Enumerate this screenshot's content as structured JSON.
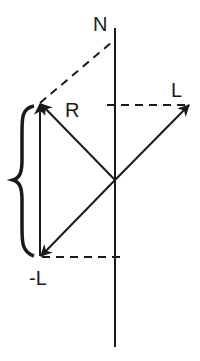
{
  "diagram": {
    "type": "vector-diagram",
    "labels": {
      "axis": "N",
      "vector_r": "R",
      "vector_l": "L",
      "vector_neg_l": "-L"
    },
    "colors": {
      "stroke": "#1a1a1a",
      "background": "#ffffff"
    },
    "elements": [
      {
        "name": "axis-N",
        "kind": "solid-line",
        "description": "vertical axis"
      },
      {
        "name": "vector-R",
        "kind": "arrow",
        "from": "origin",
        "to": "upper-left"
      },
      {
        "name": "vector-L",
        "kind": "arrow",
        "from": "origin",
        "to": "upper-right"
      },
      {
        "name": "vector-neg-L",
        "kind": "arrow",
        "from": "origin",
        "to": "lower-left"
      },
      {
        "name": "vector-vertical",
        "kind": "arrow",
        "from": "lower-left",
        "to": "upper-left"
      },
      {
        "name": "projection-L",
        "kind": "dashed-line"
      },
      {
        "name": "projection-neg-L",
        "kind": "dashed-line"
      },
      {
        "name": "projection-R-to-N",
        "kind": "dashed-line"
      },
      {
        "name": "curly-brace",
        "kind": "brace"
      }
    ]
  }
}
